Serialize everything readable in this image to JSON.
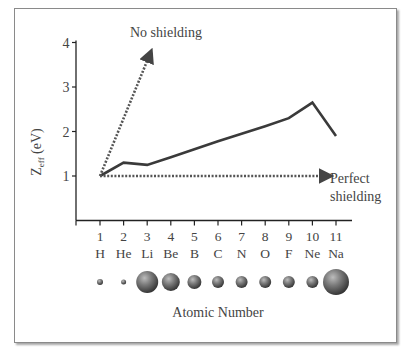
{
  "chart_data": {
    "type": "line",
    "title": "",
    "xlabel": "Atomic Number",
    "ylabel": "Z_eff (eV)",
    "ylabel_main": "Z",
    "ylabel_sub": "eff",
    "ylabel_unit": "(eV)",
    "ylim": [
      0,
      4
    ],
    "yticks": [
      "1",
      "2",
      "3",
      "4"
    ],
    "x": [
      1,
      2,
      3,
      4,
      5,
      6,
      7,
      8,
      9,
      10,
      11
    ],
    "xtick_labels": [
      "1",
      "2",
      "3",
      "4",
      "5",
      "6",
      "7",
      "8",
      "9",
      "10",
      "11"
    ],
    "element_labels": [
      "H",
      "He",
      "Li",
      "Be",
      "B",
      "C",
      "N",
      "O",
      "F",
      "Ne",
      "Na"
    ],
    "atom_radii_px": [
      3,
      2.5,
      11,
      9,
      7,
      6,
      6,
      6,
      6,
      6,
      13
    ],
    "series": [
      {
        "name": "Actual Z_eff",
        "style": "solid",
        "values": [
          1.0,
          1.3,
          1.25,
          1.42,
          1.6,
          1.78,
          1.95,
          2.12,
          2.3,
          2.65,
          1.9
        ]
      }
    ],
    "annotations": [
      {
        "label": "No shielding",
        "style": "dotted-arrow",
        "from": [
          1,
          1.0
        ],
        "to": [
          3.1,
          3.72
        ]
      },
      {
        "label_line1": "Perfect",
        "label_line2": "shielding",
        "style": "dotted-arrow",
        "from": [
          1,
          1.0
        ],
        "to": [
          10.6,
          1.0
        ]
      }
    ],
    "grid": false,
    "legend": "none"
  }
}
